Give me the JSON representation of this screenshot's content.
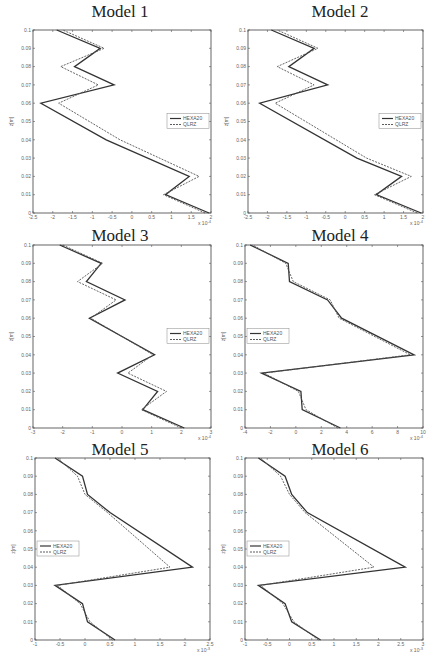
{
  "figure": {
    "legend_labels": [
      "HEXA20",
      "QLRZ"
    ],
    "y_label": "z[m]"
  },
  "chart_data": [
    {
      "type": "line",
      "title": "Model 1",
      "xlabel": "",
      "ylabel": "z[m]",
      "x_exponent": "x 10^-4",
      "xlim": [
        -2.5,
        2
      ],
      "ylim": [
        0,
        0.1
      ],
      "xticks": [
        "-2.5",
        "-2",
        "-1.5",
        "-1",
        "-0.5",
        "0",
        "0.5",
        "1",
        "1.5",
        "2"
      ],
      "yticks": [
        "0",
        "0.01",
        "0.02",
        "0.03",
        "0.04",
        "0.05",
        "0.06",
        "0.07",
        "0.08",
        "0.09",
        "0.1"
      ],
      "legend_position": "right-middle",
      "z": [
        0,
        0.01,
        0.02,
        0.04,
        0.06,
        0.07,
        0.08,
        0.09,
        0.1
      ],
      "series": [
        {
          "name": "HEXA20",
          "style": "solid",
          "values": [
            1.95,
            0.85,
            1.45,
            -0.65,
            -2.3,
            -0.45,
            -1.45,
            -0.8,
            -1.9
          ]
        },
        {
          "name": "QLRZ",
          "style": "dashed",
          "values": [
            1.85,
            0.8,
            1.7,
            -0.3,
            -1.85,
            -0.85,
            -1.8,
            -0.7,
            -1.75
          ]
        }
      ]
    },
    {
      "type": "line",
      "title": "Model 2",
      "xlabel": "",
      "ylabel": "z[m]",
      "x_exponent": "x 10^-4",
      "xlim": [
        -2.5,
        2
      ],
      "ylim": [
        0,
        0.1
      ],
      "xticks": [
        "-2.5",
        "-2",
        "-1.5",
        "-1",
        "-0.5",
        "0",
        "0.5",
        "1",
        "1.5",
        "2"
      ],
      "yticks": [
        "0",
        "0.01",
        "0.02",
        "0.03",
        "0.04",
        "0.05",
        "0.06",
        "0.07",
        "0.08",
        "0.09",
        "0.1"
      ],
      "legend_position": "right-middle",
      "z": [
        0,
        0.01,
        0.02,
        0.03,
        0.06,
        0.07,
        0.08,
        0.09,
        0.1
      ],
      "series": [
        {
          "name": "HEXA20",
          "style": "solid",
          "values": [
            1.95,
            0.8,
            1.45,
            0.3,
            -2.2,
            -0.45,
            -1.45,
            -0.8,
            -1.9
          ]
        },
        {
          "name": "QLRZ",
          "style": "dashed",
          "values": [
            1.85,
            0.75,
            1.7,
            0.55,
            -1.8,
            -0.8,
            -1.75,
            -0.7,
            -1.75
          ]
        }
      ]
    },
    {
      "type": "line",
      "title": "Model 3",
      "xlabel": "",
      "ylabel": "z[m]",
      "x_exponent": "x 10^-4",
      "xlim": [
        -3,
        3
      ],
      "ylim": [
        0,
        0.1
      ],
      "xticks": [
        "-3",
        "-2",
        "-1",
        "0",
        "1",
        "2",
        "3"
      ],
      "yticks": [
        "0",
        "0.01",
        "0.02",
        "0.03",
        "0.04",
        "0.05",
        "0.06",
        "0.07",
        "0.08",
        "0.09",
        "0.1"
      ],
      "legend_position": "right-middle",
      "z": [
        0,
        0.01,
        0.02,
        0.03,
        0.04,
        0.06,
        0.07,
        0.08,
        0.09,
        0.1
      ],
      "series": [
        {
          "name": "HEXA20",
          "style": "solid",
          "values": [
            2.1,
            0.7,
            1.2,
            -0.15,
            1.1,
            -1.1,
            0.1,
            -1.2,
            -0.7,
            -2.1
          ]
        },
        {
          "name": "QLRZ",
          "style": "dashed",
          "values": [
            2.0,
            0.65,
            1.5,
            0.2,
            1.05,
            -1.05,
            -0.2,
            -1.5,
            -0.65,
            -2.0
          ]
        }
      ]
    },
    {
      "type": "line",
      "title": "Model 4",
      "xlabel": "",
      "ylabel": "z[m]",
      "x_exponent": "x 10^-4",
      "xlim": [
        -4,
        10
      ],
      "ylim": [
        0,
        0.1
      ],
      "xticks": [
        "-4",
        "-2",
        "0",
        "2",
        "4",
        "6",
        "8",
        "10"
      ],
      "yticks": [
        "0",
        "0.01",
        "0.02",
        "0.03",
        "0.04",
        "0.05",
        "0.06",
        "0.07",
        "0.08",
        "0.09",
        "0.1"
      ],
      "legend_position": "left-middle",
      "z": [
        0,
        0.01,
        0.02,
        0.03,
        0.04,
        0.06,
        0.07,
        0.08,
        0.09,
        0.1
      ],
      "series": [
        {
          "name": "HEXA20",
          "style": "solid",
          "values": [
            3.5,
            0.5,
            0.4,
            -2.7,
            9.3,
            3.6,
            2.5,
            -0.5,
            -0.6,
            -3.6
          ]
        },
        {
          "name": "QLRZ",
          "style": "dashed",
          "values": [
            3.3,
            0.8,
            0.2,
            -2.5,
            9.0,
            3.4,
            2.7,
            -0.2,
            -0.8,
            -3.4
          ]
        }
      ]
    },
    {
      "type": "line",
      "title": "Model 5",
      "xlabel": "",
      "ylabel": "z[m]",
      "x_exponent": "x 10^-3",
      "xlim": [
        -1,
        2.5
      ],
      "ylim": [
        0,
        0.1
      ],
      "xticks": [
        "-1",
        "-0.5",
        "0",
        "0.5",
        "1",
        "1.5",
        "2",
        "2.5"
      ],
      "yticks": [
        "0",
        "0.01",
        "0.02",
        "0.03",
        "0.04",
        "0.05",
        "0.06",
        "0.07",
        "0.08",
        "0.09",
        "0.1"
      ],
      "legend_position": "left-middle",
      "z": [
        0,
        0.01,
        0.02,
        0.03,
        0.04,
        0.07,
        0.08,
        0.09,
        0.1
      ],
      "series": [
        {
          "name": "HEXA20",
          "style": "solid",
          "values": [
            0.6,
            0.05,
            -0.05,
            -0.6,
            2.15,
            0.5,
            0.05,
            -0.05,
            -0.6
          ]
        },
        {
          "name": "QLRZ",
          "style": "dashed",
          "values": [
            0.55,
            0.1,
            -0.1,
            -0.55,
            1.7,
            0.45,
            0.0,
            -0.15,
            -0.55
          ]
        }
      ]
    },
    {
      "type": "line",
      "title": "Model 6",
      "xlabel": "",
      "ylabel": "z[m]",
      "x_exponent": "x 10^-3",
      "xlim": [
        -1,
        3
      ],
      "ylim": [
        0,
        0.1
      ],
      "xticks": [
        "-1",
        "-0.5",
        "0",
        "0.5",
        "1",
        "1.5",
        "2",
        "2.5",
        "3"
      ],
      "yticks": [
        "0",
        "0.01",
        "0.02",
        "0.03",
        "0.04",
        "0.05",
        "0.06",
        "0.07",
        "0.08",
        "0.09",
        "0.1"
      ],
      "legend_position": "left-middle",
      "z": [
        0,
        0.01,
        0.02,
        0.03,
        0.04,
        0.07,
        0.08,
        0.09,
        0.1
      ],
      "series": [
        {
          "name": "HEXA20",
          "style": "solid",
          "values": [
            0.7,
            0.05,
            -0.1,
            -0.7,
            2.6,
            0.4,
            0.05,
            -0.1,
            -0.7
          ]
        },
        {
          "name": "QLRZ",
          "style": "dashed",
          "values": [
            0.65,
            0.1,
            -0.15,
            -0.65,
            1.9,
            0.35,
            0.0,
            -0.2,
            -0.65
          ]
        }
      ]
    }
  ],
  "layout": [
    {
      "title_x": 20,
      "title_y": 2,
      "left": 33,
      "top": 30,
      "width": 178,
      "height": 183
    },
    {
      "title_x": 240,
      "title_y": 2,
      "left": 248,
      "top": 30,
      "width": 175,
      "height": 183
    },
    {
      "title_x": 20,
      "title_y": 226,
      "left": 33,
      "top": 245,
      "width": 178,
      "height": 183
    },
    {
      "title_x": 240,
      "title_y": 226,
      "left": 245,
      "top": 245,
      "width": 178,
      "height": 183
    },
    {
      "title_x": 20,
      "title_y": 440,
      "left": 35,
      "top": 458,
      "width": 175,
      "height": 182
    },
    {
      "title_x": 240,
      "title_y": 440,
      "left": 245,
      "top": 458,
      "width": 178,
      "height": 182
    }
  ]
}
